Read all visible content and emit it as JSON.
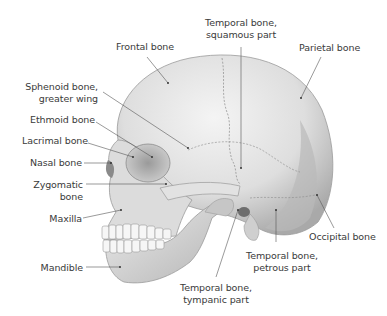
{
  "figure": {
    "labels": [
      {
        "id": "frontal",
        "text": "Frontal bone"
      },
      {
        "id": "temporal_squamous",
        "line1": "Temporal bone,",
        "line2": "squamous part"
      },
      {
        "id": "parietal",
        "text": "Parietal bone"
      },
      {
        "id": "sphenoid",
        "line1": "Sphenoid bone,",
        "line2": "greater wing"
      },
      {
        "id": "ethmoid",
        "text": "Ethmoid bone"
      },
      {
        "id": "lacrimal",
        "text": "Lacrimal bone"
      },
      {
        "id": "nasal",
        "text": "Nasal bone"
      },
      {
        "id": "zygomatic",
        "line1": "Zygomatic",
        "line2": "bone"
      },
      {
        "id": "maxilla",
        "text": "Maxilla"
      },
      {
        "id": "mandible",
        "text": "Mandible"
      },
      {
        "id": "occipital",
        "text": "Occipital bone"
      },
      {
        "id": "temporal_petrous",
        "line1": "Temporal bone,",
        "line2": "petrous part"
      },
      {
        "id": "temporal_tympanic",
        "line1": "Temporal bone,",
        "line2": "tympanic part"
      }
    ]
  },
  "colors": {
    "background": "#ffffff",
    "text": "#3a3a3a",
    "leader": "#555555",
    "bone_light": "#ececec",
    "bone_mid": "#cfcfcf",
    "bone_dark": "#8a8a8a"
  }
}
